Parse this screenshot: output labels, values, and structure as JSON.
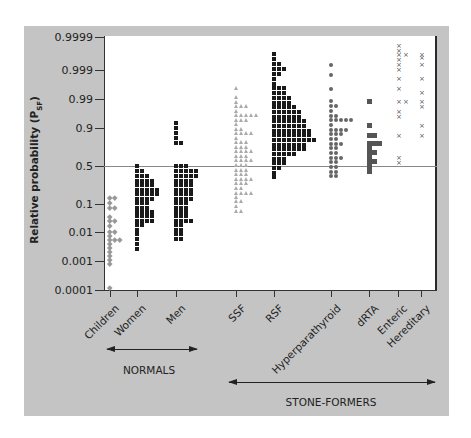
{
  "chart_data": {
    "type": "scatter",
    "title": "",
    "ylabel": "Relative probability (P",
    "ylabel_sub": "SF",
    "ylabel_close": ")",
    "yscale": "probability",
    "y_ticks": [
      "0.9999",
      "0.999",
      "0.99",
      "0.9",
      "0.5",
      "0.1",
      "0.01",
      "0.001",
      "0.0001"
    ],
    "reference_line": 0.5,
    "categories": [
      "Children",
      "Women",
      "Men",
      "SSF",
      "RSF",
      "Hyperparathyroid",
      "dRTA",
      "Enteric",
      "Hereditary"
    ],
    "groups": [
      {
        "label": "NORMALS",
        "categories": [
          "Children",
          "Women",
          "Men"
        ]
      },
      {
        "label": "STONE-FORMERS",
        "categories": [
          "SSF",
          "RSF",
          "Hyperparathyroid",
          "dRTA",
          "Enteric",
          "Hereditary"
        ]
      }
    ],
    "series": [
      {
        "name": "Children",
        "marker": "diamond",
        "color": "#999999",
        "x_px": 110,
        "rows": [
          [
            198,
            2
          ],
          [
            203,
            1
          ],
          [
            208,
            2
          ],
          [
            217,
            1
          ],
          [
            221,
            2
          ],
          [
            226,
            1
          ],
          [
            232,
            2
          ],
          [
            236,
            1
          ],
          [
            240,
            3
          ],
          [
            244,
            1
          ],
          [
            248,
            1
          ],
          [
            252,
            1
          ],
          [
            256,
            1
          ],
          [
            260,
            1
          ],
          [
            264,
            1
          ],
          [
            288,
            1
          ]
        ]
      },
      {
        "name": "Women",
        "marker": "square",
        "color": "#1a1a1a",
        "x_px": 137,
        "rows": [
          [
            166,
            1
          ],
          [
            171,
            2
          ],
          [
            176,
            3
          ],
          [
            181,
            4
          ],
          [
            185,
            4
          ],
          [
            190,
            5
          ],
          [
            194,
            5
          ],
          [
            199,
            4
          ],
          [
            203,
            3
          ],
          [
            208,
            3
          ],
          [
            212,
            4
          ],
          [
            216,
            4
          ],
          [
            221,
            4
          ],
          [
            225,
            2
          ],
          [
            230,
            1
          ],
          [
            234,
            1
          ],
          [
            239,
            1
          ],
          [
            244,
            1
          ],
          [
            249,
            1
          ]
        ]
      },
      {
        "name": "Men",
        "marker": "square",
        "color": "#1a1a1a",
        "x_px": 176,
        "rows": [
          [
            123,
            1
          ],
          [
            128,
            1
          ],
          [
            133,
            1
          ],
          [
            138,
            1
          ],
          [
            143,
            2
          ],
          [
            166,
            3
          ],
          [
            171,
            5
          ],
          [
            176,
            5
          ],
          [
            181,
            4
          ],
          [
            185,
            4
          ],
          [
            190,
            4
          ],
          [
            194,
            4
          ],
          [
            199,
            4
          ],
          [
            203,
            3
          ],
          [
            208,
            3
          ],
          [
            212,
            3
          ],
          [
            216,
            3
          ],
          [
            221,
            4
          ],
          [
            225,
            2
          ],
          [
            230,
            2
          ],
          [
            234,
            2
          ],
          [
            239,
            2
          ]
        ]
      },
      {
        "name": "SSF",
        "marker": "triangle",
        "color": "#aaaaaa",
        "x_px": 236,
        "rows": [
          [
            88,
            1
          ],
          [
            97,
            1
          ],
          [
            102,
            1
          ],
          [
            106,
            3
          ],
          [
            111,
            1
          ],
          [
            115,
            5
          ],
          [
            120,
            3
          ],
          [
            124,
            1
          ],
          [
            129,
            2
          ],
          [
            133,
            4
          ],
          [
            138,
            1
          ],
          [
            142,
            3
          ],
          [
            147,
            3
          ],
          [
            151,
            4
          ],
          [
            156,
            3
          ],
          [
            160,
            4
          ],
          [
            165,
            3
          ],
          [
            170,
            3
          ],
          [
            174,
            3
          ],
          [
            179,
            4
          ],
          [
            183,
            3
          ],
          [
            188,
            2
          ],
          [
            193,
            4
          ],
          [
            197,
            1
          ],
          [
            201,
            2
          ],
          [
            206,
            1
          ],
          [
            211,
            2
          ]
        ]
      },
      {
        "name": "RSF",
        "marker": "square",
        "color": "#1a1a1a",
        "x_px": 274,
        "rows": [
          [
            54,
            1
          ],
          [
            59,
            1
          ],
          [
            64,
            2
          ],
          [
            69,
            3
          ],
          [
            74,
            2
          ],
          [
            79,
            1
          ],
          [
            84,
            1
          ],
          [
            88,
            3
          ],
          [
            93,
            3
          ],
          [
            98,
            4
          ],
          [
            103,
            4
          ],
          [
            107,
            5
          ],
          [
            112,
            6
          ],
          [
            117,
            6
          ],
          [
            121,
            7
          ],
          [
            126,
            7
          ],
          [
            131,
            8
          ],
          [
            135,
            8
          ],
          [
            140,
            9
          ],
          [
            145,
            7
          ],
          [
            149,
            7
          ],
          [
            154,
            5
          ],
          [
            159,
            3
          ],
          [
            163,
            3
          ],
          [
            168,
            2
          ],
          [
            173,
            1
          ],
          [
            177,
            1
          ]
        ]
      },
      {
        "name": "Hyperparathyroid",
        "marker": "circle",
        "color": "#666666",
        "x_px": 331,
        "rows": [
          [
            65,
            1
          ],
          [
            75,
            1
          ],
          [
            89,
            1
          ],
          [
            101,
            1
          ],
          [
            106,
            2
          ],
          [
            111,
            1
          ],
          [
            116,
            2
          ],
          [
            120,
            5
          ],
          [
            125,
            1
          ],
          [
            130,
            4
          ],
          [
            134,
            3
          ],
          [
            139,
            2
          ],
          [
            144,
            3
          ],
          [
            148,
            2
          ],
          [
            153,
            2
          ],
          [
            158,
            3
          ],
          [
            162,
            2
          ],
          [
            167,
            2
          ],
          [
            172,
            2
          ],
          [
            176,
            2
          ]
        ]
      },
      {
        "name": "dRTA",
        "marker": "square",
        "color": "#555555",
        "x_px": 369,
        "rows": [
          [
            101,
            1
          ],
          [
            125,
            1
          ],
          [
            135,
            2
          ],
          [
            143,
            3
          ],
          [
            148,
            1
          ],
          [
            152,
            2
          ],
          [
            157,
            1
          ],
          [
            161,
            2
          ],
          [
            166,
            1
          ],
          [
            171,
            1
          ]
        ]
      },
      {
        "name": "Enteric",
        "marker": "cross",
        "color": "#555555",
        "x_px": 398,
        "rows": [
          [
            45,
            1
          ],
          [
            50,
            1
          ],
          [
            54,
            2
          ],
          [
            59,
            1
          ],
          [
            64,
            1
          ],
          [
            69,
            1
          ],
          [
            78,
            1
          ],
          [
            88,
            1
          ],
          [
            101,
            2
          ],
          [
            111,
            1
          ],
          [
            116,
            1
          ],
          [
            135,
            1
          ],
          [
            157,
            1
          ],
          [
            162,
            1
          ]
        ]
      },
      {
        "name": "Hereditary",
        "marker": "cross",
        "color": "#555555",
        "x_px": 421,
        "rows": [
          [
            54,
            1
          ],
          [
            57,
            1
          ],
          [
            64,
            1
          ],
          [
            78,
            1
          ],
          [
            92,
            1
          ],
          [
            101,
            1
          ],
          [
            106,
            1
          ],
          [
            125,
            1
          ],
          [
            135,
            1
          ]
        ]
      }
    ],
    "grid": false,
    "legend": null
  }
}
